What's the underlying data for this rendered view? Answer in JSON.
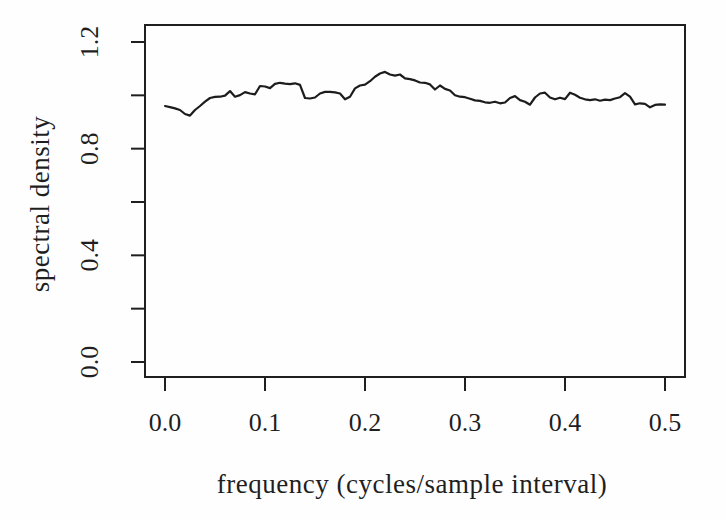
{
  "figure": {
    "background": "#fefefe",
    "ink_color": "#1f1f1f"
  },
  "chart_data": {
    "type": "line",
    "title": "",
    "xlabel": "frequency (cycles/sample interval)",
    "ylabel": "spectral density",
    "xlim": [
      0.0,
      0.5
    ],
    "ylim": [
      0.0,
      1.2
    ],
    "x_ticks": [
      0.0,
      0.1,
      0.2,
      0.3,
      0.4,
      0.5
    ],
    "x_tick_labels": [
      "0.0",
      "0.1",
      "0.2",
      "0.3",
      "0.4",
      "0.5"
    ],
    "y_ticks": [
      0.0,
      0.2,
      0.4,
      0.6,
      0.8,
      1.0,
      1.2
    ],
    "y_tick_labels": [
      "0.0",
      "",
      "0.4",
      "",
      "0.8",
      "",
      "1.2"
    ],
    "grid": false,
    "line_color": "#1c1c1c",
    "series": [
      {
        "name": "spectral density",
        "x": [
          0.0,
          0.005,
          0.01,
          0.015,
          0.02,
          0.025,
          0.03,
          0.035,
          0.04,
          0.045,
          0.05,
          0.055,
          0.06,
          0.065,
          0.07,
          0.075,
          0.08,
          0.085,
          0.09,
          0.095,
          0.1,
          0.105,
          0.11,
          0.115,
          0.12,
          0.125,
          0.13,
          0.135,
          0.14,
          0.145,
          0.15,
          0.155,
          0.16,
          0.165,
          0.17,
          0.175,
          0.18,
          0.185,
          0.19,
          0.195,
          0.2,
          0.205,
          0.21,
          0.215,
          0.22,
          0.225,
          0.23,
          0.235,
          0.24,
          0.245,
          0.25,
          0.255,
          0.26,
          0.265,
          0.27,
          0.275,
          0.28,
          0.285,
          0.29,
          0.295,
          0.3,
          0.305,
          0.31,
          0.315,
          0.32,
          0.325,
          0.33,
          0.335,
          0.34,
          0.345,
          0.35,
          0.355,
          0.36,
          0.365,
          0.37,
          0.375,
          0.38,
          0.385,
          0.39,
          0.395,
          0.4,
          0.405,
          0.41,
          0.415,
          0.42,
          0.425,
          0.43,
          0.435,
          0.44,
          0.445,
          0.45,
          0.455,
          0.46,
          0.465,
          0.47,
          0.475,
          0.48,
          0.485,
          0.49,
          0.495,
          0.5
        ],
        "y": [
          0.96,
          0.956,
          0.951,
          0.945,
          0.93,
          0.924,
          0.945,
          0.96,
          0.976,
          0.99,
          0.994,
          0.995,
          0.999,
          1.016,
          0.995,
          1.001,
          1.012,
          1.007,
          1.004,
          1.035,
          1.033,
          1.027,
          1.043,
          1.047,
          1.044,
          1.042,
          1.045,
          1.039,
          0.99,
          0.988,
          0.992,
          1.007,
          1.013,
          1.013,
          1.011,
          1.007,
          0.985,
          0.995,
          1.026,
          1.037,
          1.04,
          1.053,
          1.07,
          1.082,
          1.088,
          1.078,
          1.074,
          1.078,
          1.064,
          1.061,
          1.056,
          1.048,
          1.047,
          1.041,
          1.022,
          1.037,
          1.024,
          1.018,
          1.0,
          0.995,
          0.993,
          0.987,
          0.981,
          0.979,
          0.974,
          0.972,
          0.976,
          0.97,
          0.973,
          0.99,
          0.997,
          0.982,
          0.976,
          0.965,
          0.992,
          1.007,
          1.01,
          0.992,
          0.985,
          0.991,
          0.986,
          1.01,
          1.002,
          0.991,
          0.985,
          0.982,
          0.985,
          0.98,
          0.984,
          0.982,
          0.988,
          0.993,
          1.008,
          0.995,
          0.966,
          0.97,
          0.968,
          0.955,
          0.964,
          0.966,
          0.965
        ]
      }
    ]
  }
}
